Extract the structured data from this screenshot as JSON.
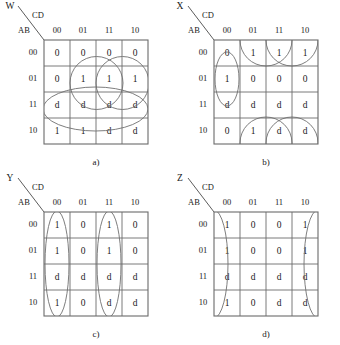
{
  "figure": {
    "type": "karnaugh-map-set",
    "count": 4,
    "row_axis_label": "AB",
    "col_axis_label": "CD",
    "col_headers": [
      "00",
      "01",
      "11",
      "10"
    ],
    "row_headers": [
      "00",
      "01",
      "11",
      "10"
    ]
  },
  "maps": [
    {
      "id": "a",
      "output": "W",
      "caption": "a)",
      "row_axis_label": "AB",
      "col_axis_label": "CD",
      "col_headers": [
        "00",
        "01",
        "11",
        "10"
      ],
      "row_headers": [
        "00",
        "01",
        "11",
        "10"
      ],
      "cells": [
        [
          "0",
          "0",
          "0",
          "0"
        ],
        [
          "0",
          "1",
          "1",
          "1"
        ],
        [
          "d",
          "d",
          "d",
          "d"
        ],
        [
          "1",
          "1",
          "d",
          "d"
        ]
      ],
      "groups": [
        {
          "name": "circle-left",
          "shape": "circle",
          "cx": 96.5,
          "cy": 83.0,
          "r": 26.5
        },
        {
          "name": "circle-right",
          "shape": "circle",
          "cx": 122.5,
          "cy": 83.0,
          "r": 26.5
        },
        {
          "name": "ellipse-wide",
          "shape": "ellipse",
          "cx": 95.5,
          "cy": 109.0,
          "rx": 52.5,
          "ry": 22.0
        }
      ]
    },
    {
      "id": "b",
      "output": "X",
      "caption": "b)",
      "row_axis_label": "AB",
      "col_axis_label": "CD",
      "col_headers": [
        "00",
        "01",
        "11",
        "10"
      ],
      "row_headers": [
        "00",
        "01",
        "11",
        "10"
      ],
      "cells": [
        [
          "0",
          "1",
          "1",
          "1"
        ],
        [
          "1",
          "0",
          "0",
          "0"
        ],
        [
          "d",
          "d",
          "d",
          "d"
        ],
        [
          "0",
          "1",
          "d",
          "d"
        ]
      ],
      "groups": [
        {
          "name": "ellipse-col00-rows0111",
          "shape": "ellipse",
          "cx": 57.0,
          "cy": 79.0,
          "rx": 12.0,
          "ry": 27.0
        },
        {
          "name": "circle-top-left",
          "shape": "circle",
          "cx": 96.0,
          "cy": 40.0,
          "r": 26.0
        },
        {
          "name": "circle-top-right",
          "shape": "circle",
          "cx": 122.0,
          "cy": 40.0,
          "r": 26.0
        },
        {
          "name": "circle-bottom-left",
          "shape": "circle",
          "cx": 96.0,
          "cy": 143.0,
          "r": 26.0
        },
        {
          "name": "circle-bottom-right",
          "shape": "circle",
          "cx": 122.0,
          "cy": 143.0,
          "r": 26.0
        }
      ]
    },
    {
      "id": "c",
      "output": "Y",
      "caption": "c)",
      "row_axis_label": "AB",
      "col_axis_label": "CD",
      "col_headers": [
        "00",
        "01",
        "11",
        "10"
      ],
      "row_headers": [
        "00",
        "01",
        "11",
        "10"
      ],
      "cells": [
        [
          "1",
          "0",
          "1",
          "0"
        ],
        [
          "1",
          "0",
          "1",
          "0"
        ],
        [
          "d",
          "d",
          "d",
          "d"
        ],
        [
          "1",
          "0",
          "d",
          "d"
        ]
      ],
      "groups": [
        {
          "name": "ellipse-col00",
          "shape": "ellipse",
          "cx": 57.0,
          "cy": 92.0,
          "rx": 12.0,
          "ry": 53.0
        },
        {
          "name": "ellipse-col11",
          "shape": "ellipse",
          "cx": 109.0,
          "cy": 92.0,
          "rx": 12.0,
          "ry": 53.0
        }
      ]
    },
    {
      "id": "d",
      "output": "Z",
      "caption": "d)",
      "row_axis_label": "AB",
      "col_axis_label": "CD",
      "col_headers": [
        "00",
        "01",
        "11",
        "10"
      ],
      "row_headers": [
        "00",
        "01",
        "11",
        "10"
      ],
      "cells": [
        [
          "1",
          "0",
          "0",
          "1"
        ],
        [
          "1",
          "0",
          "0",
          "1"
        ],
        [
          "d",
          "d",
          "d",
          "d"
        ],
        [
          "1",
          "0",
          "d",
          "d"
        ]
      ],
      "groups": [
        {
          "name": "half-ellipse-left-wrap",
          "shape": "half-ellipse-right",
          "cx": 44.0,
          "cy": 92.0,
          "rx": 14.0,
          "ry": 54.0
        },
        {
          "name": "half-ellipse-right-wrap",
          "shape": "half-ellipse-left",
          "cx": 148.0,
          "cy": 92.0,
          "rx": 14.0,
          "ry": 54.0
        }
      ]
    }
  ]
}
